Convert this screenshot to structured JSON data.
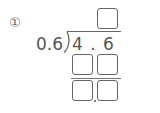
{
  "problem": {
    "number_label": "①",
    "divisor": "0.6",
    "dividend": "4 . 6",
    "quotient_boxes": 1,
    "work_rows": [
      {
        "boxes": 2
      },
      {
        "boxes": 2,
        "decimal_point_between": true
      }
    ]
  },
  "colors": {
    "ink": "#555555",
    "box_border": "#666666",
    "background": "#ffffff"
  },
  "icons": {
    "division-bracket": "long-division-bracket"
  }
}
